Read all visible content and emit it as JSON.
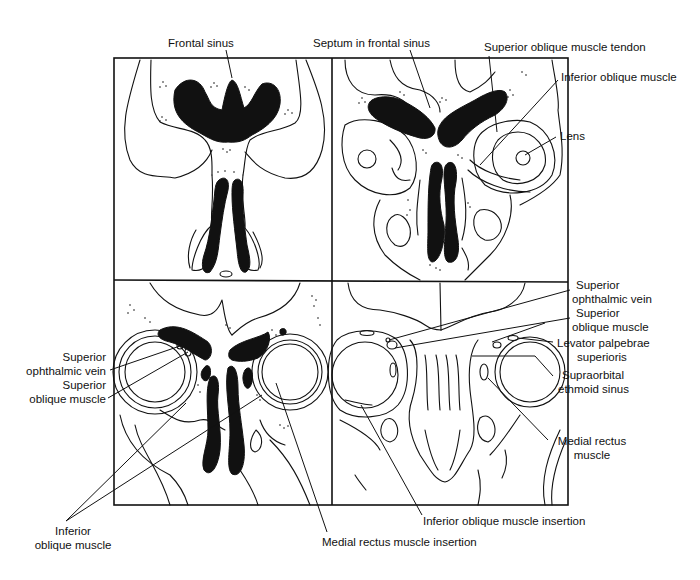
{
  "figure": {
    "panels": [
      {
        "id": "top-left",
        "position": "top-left"
      },
      {
        "id": "top-right",
        "position": "top-right"
      },
      {
        "id": "bottom-left",
        "position": "bottom-left"
      },
      {
        "id": "bottom-right",
        "position": "bottom-right"
      }
    ],
    "colors": {
      "ink": "#111111",
      "background": "#ffffff"
    }
  },
  "labels": {
    "frontal_sinus": "Frontal sinus",
    "septum_frontal_sinus": "Septum in frontal sinus",
    "sup_oblique_tendon": "Superior oblique muscle tendon",
    "inf_oblique_top": "Inferior oblique muscle",
    "lens": "Lens",
    "sup_ophthalmic_vein_left_1": "Superior",
    "sup_ophthalmic_vein_left_2": "ophthalmic vein",
    "sup_oblique_left_1": "Superior",
    "sup_oblique_left_2": "oblique muscle",
    "inf_oblique_bottom_1": "Inferior",
    "inf_oblique_bottom_2": "oblique muscle",
    "medial_rectus_insertion": "Medial rectus muscle insertion",
    "inf_oblique_insertion": "Inferior oblique muscle insertion",
    "sup_ophthalmic_vein_right_1": "Superior",
    "sup_ophthalmic_vein_right_2": "ophthalmic vein",
    "sup_oblique_right_1": "Superior",
    "sup_oblique_right_2": "oblique muscle",
    "levator_1": "Levator palpebrae",
    "levator_2": "superioris",
    "supraorbital_ethmoid_1": "Supraorbital",
    "supraorbital_ethmoid_2": "ethmoid sinus",
    "medial_rectus_1": "Medial rectus",
    "medial_rectus_2": "muscle"
  }
}
